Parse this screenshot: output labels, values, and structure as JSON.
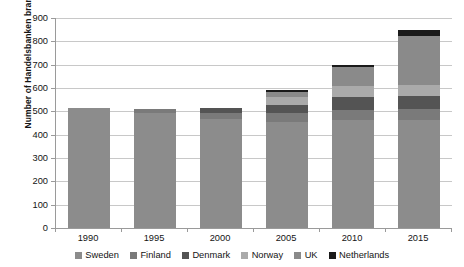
{
  "chart_data": {
    "type": "bar",
    "subtype": "stacked-bar",
    "title": "",
    "xlabel": "",
    "ylabel": "Number of Handelsbanken branches",
    "categories": [
      "1990",
      "1995",
      "2000",
      "2005",
      "2010",
      "2015"
    ],
    "ylim": [
      0,
      900
    ],
    "ytick_values": [
      0,
      100,
      200,
      300,
      400,
      500,
      600,
      700,
      800,
      900
    ],
    "ytick_labels": [
      "0",
      "100",
      "200",
      "300",
      "400",
      "500",
      "600",
      "700",
      "800",
      "900"
    ],
    "grid": "horizontal",
    "legend_position": "bottom",
    "series": [
      {
        "name": "Sweden",
        "color": "#8c8c8c",
        "values": [
          514,
          495,
          466,
          455,
          461,
          462
        ]
      },
      {
        "name": "Finland",
        "color": "#7a7a7a",
        "values": [
          0,
          15,
          27,
          38,
          45,
          46
        ]
      },
      {
        "name": "Denmark",
        "color": "#545454",
        "values": [
          0,
          0,
          22,
          33,
          54,
          56
        ]
      },
      {
        "name": "Norway",
        "color": "#aaaaaa",
        "values": [
          0,
          0,
          0,
          36,
          48,
          49
        ]
      },
      {
        "name": "UK",
        "color": "#8a8a8a",
        "values": [
          0,
          0,
          0,
          22,
          82,
          208
        ]
      },
      {
        "name": "Netherlands",
        "color": "#1a1a1a",
        "values": [
          0,
          0,
          0,
          6,
          10,
          29
        ]
      }
    ],
    "totals": [
      514,
      510,
      515,
      590,
      700,
      850
    ]
  },
  "axis": {
    "y_title": "Number of Handelsbanken branches"
  },
  "legend": {
    "items": [
      {
        "label": "Sweden"
      },
      {
        "label": "Finland"
      },
      {
        "label": "Denmark"
      },
      {
        "label": "Norway"
      },
      {
        "label": "UK"
      },
      {
        "label": "Netherlands"
      }
    ]
  }
}
